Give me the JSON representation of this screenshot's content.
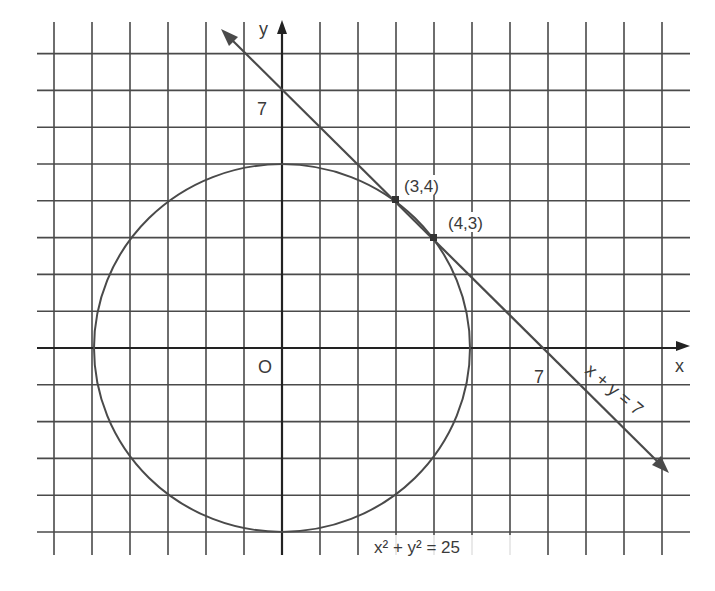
{
  "figure": {
    "title": "",
    "grid": {
      "x_min": -6,
      "x_max": 10,
      "y_min": -5,
      "y_max": 8,
      "step": 1
    },
    "axes": {
      "x_label": "x",
      "y_label": "y",
      "origin_label": "O"
    },
    "circle": {
      "equation_label": "x² + y² = 25",
      "center": [
        0,
        0
      ],
      "radius": 5
    },
    "line": {
      "equation_label": "x + y = 7",
      "x_intercept_label": "7",
      "y_intercept_label": "7"
    },
    "points": [
      {
        "label": "(3,4)",
        "x": 3,
        "y": 4
      },
      {
        "label": "(4,3)",
        "x": 4,
        "y": 3
      }
    ],
    "colors": {
      "ink": "#3a3a3a",
      "grid": "#4a4a4a",
      "background": "#ffffff"
    }
  }
}
